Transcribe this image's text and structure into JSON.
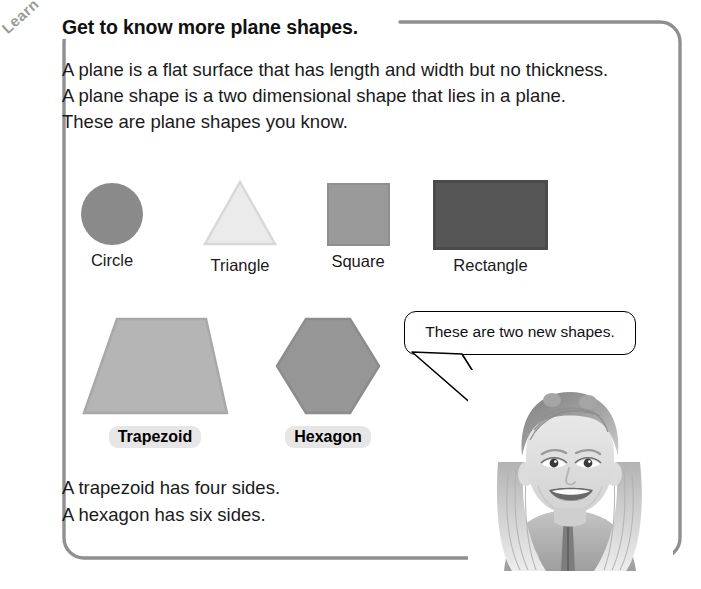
{
  "page": {
    "tab_label": "Learn",
    "heading": "Get to know more plane shapes.",
    "border_color": "#8f8f8f",
    "background": "#ffffff"
  },
  "intro": {
    "line1": "A plane is a flat surface that has length and width but no thickness.",
    "line2": "A plane shape is a two dimensional shape that lies in a plane.",
    "line3": "These are plane shapes you know."
  },
  "shapes_row1": [
    {
      "name": "Circle",
      "icon": "circle-shape",
      "fill": "#8a8a8a",
      "stroke": "#8a8a8a"
    },
    {
      "name": "Triangle",
      "icon": "triangle-shape",
      "fill": "#ebebeb",
      "stroke": "#d8d8d8"
    },
    {
      "name": "Square",
      "icon": "square-shape",
      "fill": "#9a9a9a",
      "stroke": "#8e8e8e"
    },
    {
      "name": "Rectangle",
      "icon": "rectangle-shape",
      "fill": "#565656",
      "stroke": "#4a4a4a"
    }
  ],
  "shapes_row2": [
    {
      "name": "Trapezoid",
      "icon": "trapezoid-shape",
      "fill": "#b5b5b5",
      "stroke": "#a8a8a8"
    },
    {
      "name": "Hexagon",
      "icon": "hexagon-shape",
      "fill": "#969696",
      "stroke": "#8c8c8c"
    }
  ],
  "bubble": {
    "text": "These are two new shapes."
  },
  "closing": {
    "line1": "A trapezoid has four sides.",
    "line2": "A hexagon has six sides."
  },
  "photo": {
    "alt": "smiling girl photo"
  }
}
